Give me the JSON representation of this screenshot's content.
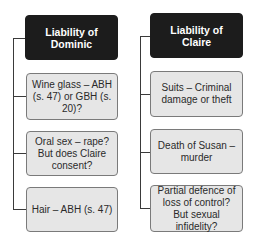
{
  "columns": [
    {
      "header": "Liability of Dominic",
      "items": [
        "Wine glass – ABH (s. 47) or GBH (s. 20)?",
        "Oral sex – rape? But does Claire consent?",
        "Hair – ABH (s. 47)"
      ]
    },
    {
      "header": "Liability of Claire",
      "items": [
        "Suits – Criminal damage or theft",
        "Death of Susan – murder",
        "Partial defence of loss of control? But sexual infidelity?"
      ]
    }
  ],
  "colors": {
    "header_bg": "#1c1c1c",
    "item_bg": "#e6e6e6",
    "connector": "#3a3a3a"
  }
}
